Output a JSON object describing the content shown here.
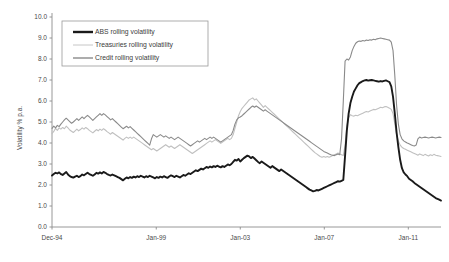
{
  "chart_data": {
    "type": "line",
    "title": "",
    "xlabel": "",
    "ylabel": "Volatility % p.a.",
    "ylim": [
      0.0,
      10.0
    ],
    "y_ticks": [
      "0.0",
      "1.0",
      "2.0",
      "3.0",
      "4.0",
      "5.0",
      "6.0",
      "7.0",
      "8.0",
      "9.0",
      "10.0"
    ],
    "y_tick_values": [
      0,
      1,
      2,
      3,
      4,
      5,
      6,
      7,
      8,
      9,
      10
    ],
    "x_ticks": [
      "Dec-94",
      "Jan-99",
      "Jan-03",
      "Jan-07",
      "Jan-11"
    ],
    "x_tick_positions": [
      0,
      0.268,
      0.484,
      0.7,
      0.916
    ],
    "grid": false,
    "legend_position": "top-left",
    "legend": [
      "ABS rolling volatility",
      "Treasuries rolling volatility",
      "Credit rolling volatility"
    ],
    "colors": {
      "abs": "#1a1a1a",
      "treasuries": "#c0c0c0",
      "credit": "#8a8a8a",
      "axis": "#8c8c8c",
      "legend_border": "#9a9a9a",
      "background": "#ffffff"
    },
    "series": [
      {
        "name": "ABS rolling volatility",
        "color": "#1a1a1a",
        "width": 1.9,
        "values": [
          2.45,
          2.52,
          2.58,
          2.55,
          2.6,
          2.52,
          2.48,
          2.55,
          2.62,
          2.5,
          2.42,
          2.38,
          2.35,
          2.4,
          2.44,
          2.38,
          2.42,
          2.5,
          2.46,
          2.52,
          2.58,
          2.52,
          2.48,
          2.44,
          2.5,
          2.58,
          2.54,
          2.6,
          2.55,
          2.62,
          2.58,
          2.52,
          2.48,
          2.45,
          2.5,
          2.46,
          2.42,
          2.38,
          2.34,
          2.28,
          2.22,
          2.3,
          2.36,
          2.32,
          2.38,
          2.34,
          2.4,
          2.36,
          2.42,
          2.38,
          2.44,
          2.4,
          2.36,
          2.42,
          2.38,
          2.44,
          2.4,
          2.36,
          2.32,
          2.38,
          2.34,
          2.4,
          2.36,
          2.42,
          2.38,
          2.34,
          2.4,
          2.46,
          2.42,
          2.38,
          2.44,
          2.4,
          2.36,
          2.42,
          2.48,
          2.44,
          2.5,
          2.56,
          2.52,
          2.58,
          2.64,
          2.7,
          2.66,
          2.72,
          2.78,
          2.74,
          2.8,
          2.86,
          2.82,
          2.88,
          2.84,
          2.9,
          2.86,
          2.92,
          2.88,
          2.84,
          2.9,
          2.86,
          2.92,
          2.98,
          2.94,
          3.0,
          3.1,
          3.2,
          3.16,
          3.24,
          3.12,
          3.2,
          3.28,
          3.34,
          3.4,
          3.36,
          3.28,
          3.34,
          3.26,
          3.18,
          3.1,
          3.04,
          3.12,
          3.06,
          3.0,
          2.94,
          2.88,
          2.82,
          2.9,
          2.84,
          2.78,
          2.72,
          2.66,
          2.74,
          2.68,
          2.62,
          2.56,
          2.5,
          2.44,
          2.38,
          2.32,
          2.26,
          2.2,
          2.14,
          2.08,
          2.02,
          1.96,
          1.9,
          1.84,
          1.78,
          1.74,
          1.7,
          1.72,
          1.76,
          1.74,
          1.78,
          1.82,
          1.86,
          1.9,
          1.94,
          1.98,
          2.02,
          2.06,
          2.1,
          2.14,
          2.18,
          2.16,
          2.2,
          2.24,
          3.4,
          4.6,
          5.4,
          5.9,
          6.2,
          6.45,
          6.6,
          6.75,
          6.85,
          6.9,
          6.95,
          6.98,
          7.0,
          6.97,
          6.99,
          7.0,
          6.98,
          6.96,
          6.94,
          6.92,
          6.95,
          6.93,
          6.96,
          6.98,
          6.94,
          6.9,
          6.7,
          6.2,
          5.4,
          4.5,
          3.8,
          3.2,
          2.8,
          2.6,
          2.5,
          2.42,
          2.3,
          2.24,
          2.18,
          2.1,
          2.04,
          1.98,
          1.92,
          1.86,
          1.8,
          1.74,
          1.68,
          1.62,
          1.56,
          1.5,
          1.44,
          1.38,
          1.34,
          1.3,
          1.26
        ]
      },
      {
        "name": "Treasuries rolling volatility",
        "color": "#c0c0c0",
        "width": 1.1,
        "values": [
          4.45,
          4.55,
          4.7,
          4.6,
          4.72,
          4.66,
          4.74,
          4.68,
          4.8,
          4.72,
          4.62,
          4.56,
          4.5,
          4.58,
          4.66,
          4.58,
          4.64,
          4.72,
          4.66,
          4.74,
          4.68,
          4.6,
          4.54,
          4.48,
          4.56,
          4.64,
          4.58,
          4.66,
          4.6,
          4.68,
          4.62,
          4.54,
          4.48,
          4.42,
          4.5,
          4.44,
          4.38,
          4.32,
          4.26,
          4.2,
          4.14,
          4.22,
          4.28,
          4.22,
          4.28,
          4.22,
          4.28,
          4.22,
          4.16,
          4.1,
          4.04,
          3.98,
          3.92,
          3.86,
          3.8,
          3.74,
          3.68,
          3.74,
          3.68,
          3.62,
          3.68,
          3.74,
          3.8,
          3.86,
          3.92,
          3.86,
          3.8,
          3.86,
          3.8,
          3.74,
          3.8,
          3.86,
          3.92,
          3.86,
          3.8,
          3.74,
          3.68,
          3.62,
          3.56,
          3.5,
          3.56,
          3.62,
          3.68,
          3.74,
          3.8,
          3.86,
          3.92,
          3.98,
          4.04,
          4.1,
          4.04,
          4.1,
          4.16,
          4.1,
          4.04,
          3.98,
          4.04,
          4.1,
          4.16,
          4.22,
          4.16,
          4.22,
          4.4,
          4.7,
          5.0,
          5.3,
          5.5,
          5.65,
          5.75,
          5.85,
          5.95,
          6.05,
          6.1,
          6.15,
          6.05,
          6.1,
          6.0,
          5.9,
          5.8,
          5.7,
          5.78,
          5.7,
          5.62,
          5.54,
          5.46,
          5.38,
          5.3,
          5.22,
          5.14,
          5.06,
          4.98,
          4.9,
          4.82,
          4.74,
          4.66,
          4.58,
          4.5,
          4.42,
          4.34,
          4.26,
          4.18,
          4.1,
          4.02,
          3.94,
          3.86,
          3.78,
          3.7,
          3.62,
          3.54,
          3.48,
          3.42,
          3.36,
          3.32,
          3.36,
          3.32,
          3.36,
          3.32,
          3.36,
          3.4,
          3.44,
          3.48,
          3.52,
          3.48,
          3.44,
          3.4,
          3.9,
          4.8,
          5.2,
          5.35,
          5.3,
          5.28,
          5.32,
          5.3,
          5.34,
          5.38,
          5.42,
          5.46,
          5.5,
          5.48,
          5.52,
          5.56,
          5.6,
          5.58,
          5.62,
          5.66,
          5.7,
          5.68,
          5.72,
          5.74,
          5.7,
          5.66,
          5.6,
          5.4,
          4.9,
          4.4,
          4.1,
          3.9,
          3.8,
          3.74,
          3.7,
          3.66,
          3.62,
          3.58,
          3.54,
          3.5,
          3.46,
          3.42,
          3.48,
          3.44,
          3.4,
          3.46,
          3.42,
          3.38,
          3.44,
          3.4,
          3.46,
          3.42,
          3.4,
          3.38,
          3.36
        ]
      },
      {
        "name": "Credit rolling volatility",
        "color": "#8a8a8a",
        "width": 1.1,
        "values": [
          4.7,
          4.8,
          4.72,
          4.84,
          4.78,
          4.9,
          5.0,
          5.1,
          5.18,
          5.1,
          5.02,
          4.94,
          5.0,
          5.08,
          5.16,
          5.08,
          5.16,
          5.24,
          5.16,
          5.24,
          5.32,
          5.24,
          5.16,
          5.08,
          5.16,
          5.24,
          5.32,
          5.4,
          5.32,
          5.4,
          5.34,
          5.26,
          5.18,
          5.1,
          5.16,
          5.08,
          5.0,
          4.92,
          4.84,
          4.76,
          4.68,
          4.74,
          4.8,
          4.72,
          4.78,
          4.7,
          4.62,
          4.54,
          4.46,
          4.38,
          4.3,
          4.22,
          4.14,
          4.06,
          3.98,
          3.9,
          4.2,
          4.4,
          4.34,
          4.28,
          4.34,
          4.4,
          4.34,
          4.28,
          4.34,
          4.28,
          4.22,
          4.28,
          4.22,
          4.16,
          4.22,
          4.28,
          4.22,
          4.16,
          4.1,
          4.04,
          3.98,
          3.92,
          3.86,
          3.92,
          3.98,
          4.04,
          4.1,
          4.04,
          4.1,
          4.16,
          4.22,
          4.16,
          4.22,
          4.28,
          4.22,
          4.28,
          4.22,
          4.16,
          4.1,
          4.04,
          4.1,
          4.16,
          4.22,
          4.28,
          4.34,
          4.4,
          4.6,
          4.9,
          5.1,
          5.2,
          5.24,
          5.3,
          5.38,
          5.46,
          5.54,
          5.62,
          5.7,
          5.76,
          5.7,
          5.76,
          5.7,
          5.64,
          5.58,
          5.52,
          5.58,
          5.52,
          5.46,
          5.4,
          5.34,
          5.28,
          5.22,
          5.16,
          5.1,
          5.04,
          4.98,
          4.92,
          4.86,
          4.8,
          4.74,
          4.68,
          4.62,
          4.56,
          4.5,
          4.44,
          4.38,
          4.32,
          4.26,
          4.2,
          4.14,
          4.08,
          4.02,
          3.96,
          3.9,
          3.84,
          3.78,
          3.72,
          3.66,
          3.6,
          3.56,
          3.52,
          3.48,
          3.44,
          3.42,
          3.4,
          3.44,
          3.48,
          3.44,
          4.2,
          6.0,
          7.9,
          8.0,
          7.95,
          8.1,
          8.4,
          8.6,
          8.75,
          8.82,
          8.86,
          8.84,
          8.88,
          8.86,
          8.9,
          8.88,
          8.92,
          8.9,
          8.94,
          8.92,
          8.96,
          8.98,
          9.0,
          8.98,
          8.96,
          8.94,
          8.92,
          8.9,
          8.8,
          8.4,
          7.2,
          5.8,
          4.9,
          4.4,
          4.2,
          4.1,
          4.05,
          4.0,
          3.96,
          3.92,
          3.88,
          3.86,
          3.9,
          4.2,
          4.28,
          4.24,
          4.26,
          4.28,
          4.26,
          4.24,
          4.26,
          4.28,
          4.26,
          4.24,
          4.26,
          4.28,
          4.26
        ]
      }
    ]
  },
  "axis": {
    "y_title": "Volatility % p.a."
  }
}
